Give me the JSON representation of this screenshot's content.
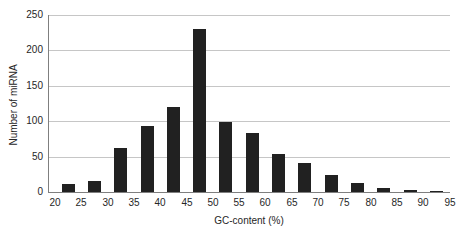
{
  "chart_data": {
    "type": "bar",
    "title": "",
    "xlabel": "GC-content (%)",
    "ylabel": "Number of miRNA",
    "categories": [
      "20-25",
      "25-30",
      "30-35",
      "35-40",
      "40-45",
      "45-50",
      "50-55",
      "55-60",
      "60-65",
      "65-70",
      "70-75",
      "75-80",
      "80-85",
      "85-90",
      "90-95"
    ],
    "values": [
      12,
      16,
      62,
      93,
      120,
      230,
      99,
      83,
      53,
      41,
      24,
      13,
      5,
      3,
      1
    ],
    "x_tick_labels": [
      "20",
      "25",
      "30",
      "35",
      "40",
      "45",
      "50",
      "55",
      "60",
      "65",
      "70",
      "75",
      "80",
      "85",
      "90",
      "95"
    ],
    "y_ticks": [
      0,
      50,
      100,
      150,
      200,
      250
    ],
    "ylim": [
      0,
      250
    ],
    "xlim": [
      20,
      95
    ],
    "grid": "horizontal-gridlines",
    "legend": "none",
    "colors": {
      "bar": "#212121",
      "gridline": "#c6c6c6",
      "axis": "#7f7f7f",
      "text": "#262626",
      "background": "#ffffff"
    }
  }
}
